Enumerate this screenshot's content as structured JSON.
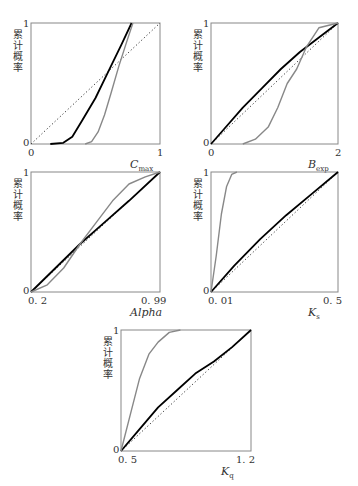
{
  "figure": {
    "ylabel": "累计概率",
    "colors": {
      "prior": "#000000",
      "posterior": "#888888",
      "uniform": "#333333",
      "frame": "#888888"
    }
  },
  "chart_data": [
    {
      "type": "line",
      "xlabel": "C",
      "xlabel_sub": "max",
      "ylabel": "累计概率",
      "xlim": [
        0,
        1
      ],
      "ylim": [
        0,
        1
      ],
      "x_ticks": [
        "0",
        "1"
      ],
      "y_ticks": [
        "0",
        "1"
      ],
      "series": [
        {
          "name": "uniform",
          "style": "dotted",
          "x": [
            0,
            1
          ],
          "y": [
            0,
            1
          ]
        },
        {
          "name": "black",
          "style": "solid",
          "x": [
            0.15,
            0.25,
            0.32,
            0.4,
            0.5,
            0.6,
            0.7,
            0.78
          ],
          "y": [
            0,
            0.01,
            0.06,
            0.2,
            0.38,
            0.6,
            0.82,
            1.0
          ]
        },
        {
          "name": "gray",
          "style": "solid",
          "x": [
            0.42,
            0.47,
            0.52,
            0.57,
            0.62,
            0.68,
            0.74,
            0.79
          ],
          "y": [
            0,
            0.02,
            0.1,
            0.24,
            0.42,
            0.64,
            0.84,
            1.0
          ]
        }
      ]
    },
    {
      "type": "line",
      "xlabel": "B",
      "xlabel_sub": "exp",
      "ylabel": "累计概率",
      "xlim": [
        0,
        2
      ],
      "ylim": [
        0,
        1
      ],
      "x_ticks": [
        "0",
        "2"
      ],
      "y_ticks": [
        "0",
        "1"
      ],
      "series": [
        {
          "name": "uniform",
          "style": "dotted",
          "x": [
            0,
            2
          ],
          "y": [
            0,
            1
          ]
        },
        {
          "name": "black",
          "style": "solid",
          "x": [
            0,
            0.2,
            0.5,
            0.8,
            1.1,
            1.4,
            1.7,
            2.0
          ],
          "y": [
            0,
            0.12,
            0.3,
            0.46,
            0.62,
            0.76,
            0.88,
            1.0
          ]
        },
        {
          "name": "gray",
          "style": "solid",
          "x": [
            0.5,
            0.7,
            0.9,
            1.05,
            1.2,
            1.35,
            1.5,
            1.7,
            2.0
          ],
          "y": [
            0,
            0.04,
            0.14,
            0.3,
            0.5,
            0.62,
            0.8,
            0.96,
            1.0
          ]
        }
      ]
    },
    {
      "type": "line",
      "xlabel": "Alpha",
      "xlabel_sub": "",
      "ylabel": "累计概率",
      "xlim": [
        0.2,
        0.99
      ],
      "ylim": [
        0,
        1
      ],
      "x_ticks": [
        "0. 2",
        "0. 99"
      ],
      "y_ticks": [
        "0",
        "1"
      ],
      "series": [
        {
          "name": "uniform",
          "style": "dotted",
          "x": [
            0.2,
            0.99
          ],
          "y": [
            0,
            1
          ]
        },
        {
          "name": "black",
          "style": "solid",
          "x": [
            0.2,
            0.35,
            0.5,
            0.65,
            0.8,
            0.99
          ],
          "y": [
            0,
            0.2,
            0.4,
            0.58,
            0.76,
            1.0
          ]
        },
        {
          "name": "gray",
          "style": "solid",
          "x": [
            0.2,
            0.3,
            0.4,
            0.5,
            0.6,
            0.7,
            0.8,
            0.9,
            0.99
          ],
          "y": [
            0,
            0.06,
            0.2,
            0.4,
            0.58,
            0.76,
            0.9,
            0.96,
            1.0
          ]
        }
      ]
    },
    {
      "type": "line",
      "xlabel": "K",
      "xlabel_sub": "s",
      "ylabel": "累计概率",
      "xlim": [
        0.01,
        0.5
      ],
      "ylim": [
        0,
        1
      ],
      "x_ticks": [
        "0. 01",
        "0. 5"
      ],
      "y_ticks": [
        "0",
        "1"
      ],
      "series": [
        {
          "name": "uniform",
          "style": "dotted",
          "x": [
            0.01,
            0.5
          ],
          "y": [
            0,
            1
          ]
        },
        {
          "name": "black",
          "style": "solid",
          "x": [
            0.01,
            0.1,
            0.2,
            0.3,
            0.4,
            0.5
          ],
          "y": [
            0,
            0.22,
            0.44,
            0.64,
            0.82,
            1.0
          ]
        },
        {
          "name": "gray",
          "style": "solid",
          "x": [
            0.01,
            0.03,
            0.05,
            0.07,
            0.09,
            0.11
          ],
          "y": [
            0,
            0.3,
            0.65,
            0.88,
            0.98,
            1.0
          ]
        }
      ]
    },
    {
      "type": "line",
      "xlabel": "K",
      "xlabel_sub": "q",
      "ylabel": "累计概率",
      "xlim": [
        0.5,
        1.2
      ],
      "ylim": [
        0,
        1
      ],
      "x_ticks": [
        "0. 5",
        "1. 2"
      ],
      "y_ticks": [
        "0",
        "1"
      ],
      "series": [
        {
          "name": "uniform",
          "style": "dotted",
          "x": [
            0.5,
            1.2
          ],
          "y": [
            0,
            1
          ]
        },
        {
          "name": "black",
          "style": "solid",
          "x": [
            0.5,
            0.6,
            0.7,
            0.8,
            0.9,
            1.0,
            1.1,
            1.2
          ],
          "y": [
            0,
            0.18,
            0.36,
            0.5,
            0.64,
            0.74,
            0.86,
            1.0
          ]
        },
        {
          "name": "gray",
          "style": "solid",
          "x": [
            0.5,
            0.55,
            0.6,
            0.65,
            0.7,
            0.76,
            0.82
          ],
          "y": [
            0,
            0.3,
            0.6,
            0.8,
            0.9,
            0.98,
            1.0
          ]
        }
      ]
    }
  ]
}
